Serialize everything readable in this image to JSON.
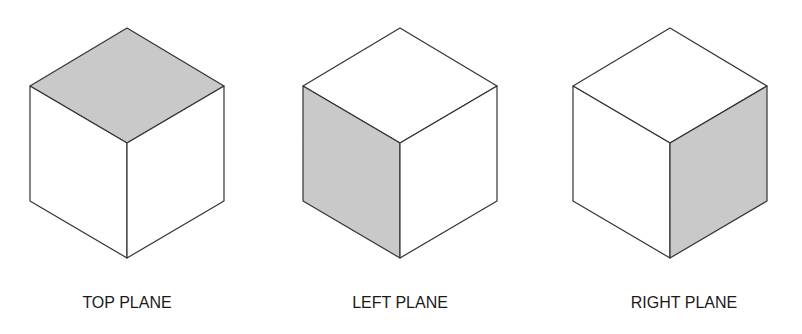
{
  "diagram": {
    "colors": {
      "edge": "#333333",
      "shaded": "#c9c9c9",
      "face": "#ffffff"
    },
    "cubes": [
      {
        "label": "TOP PLANE",
        "shaded_face": "top",
        "cx": 127,
        "label_x": 127
      },
      {
        "label": "LEFT PLANE",
        "shaded_face": "left",
        "cx": 400,
        "label_x": 400
      },
      {
        "label": "RIGHT PLANE",
        "shaded_face": "right",
        "cx": 670,
        "label_x": 684
      }
    ]
  }
}
